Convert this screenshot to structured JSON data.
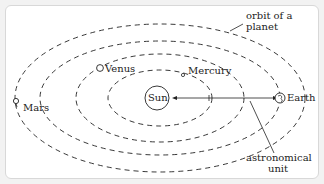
{
  "diagram": {
    "type": "solar-system-orbits",
    "bodies": [
      {
        "name": "Sun",
        "label": "Sun"
      },
      {
        "name": "Mercury",
        "label": "Mercury"
      },
      {
        "name": "Venus",
        "label": "Venus"
      },
      {
        "name": "Earth",
        "label": "Earth"
      },
      {
        "name": "Mars",
        "label": "Mars"
      }
    ],
    "annotations": {
      "orbit": "orbit of a\nplanet",
      "orbit_line1": "orbit of a",
      "orbit_line2": "planet",
      "au_line1": "astronomical",
      "au_line2": "unit"
    },
    "colors": {
      "line": "#222222",
      "background": "#ffffff",
      "frame": "#d8d8d8"
    }
  }
}
